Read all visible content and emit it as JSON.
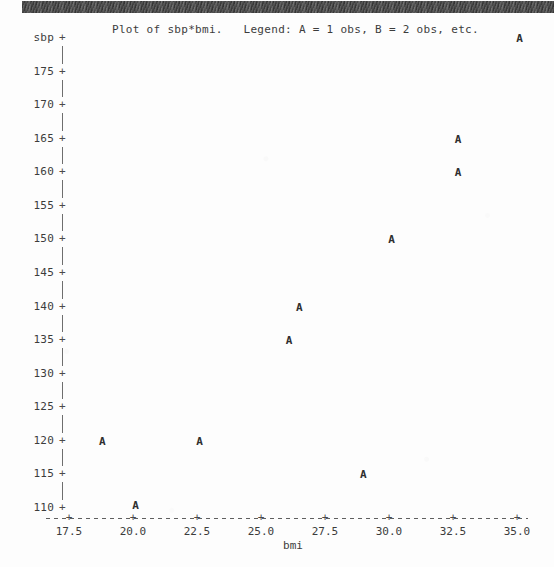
{
  "banner": {
    "name": "scan-edge-strip"
  },
  "title": "Plot of sbp*bmi.   Legend: A = 1 obs, B = 2 obs, etc.",
  "axis_title_x": "bmi",
  "axis_title_y": "sbp",
  "chart_data": {
    "type": "scatter",
    "title": "Plot of sbp*bmi.   Legend: A = 1 obs, B = 2 obs, etc.",
    "xlabel": "bmi",
    "ylabel": "sbp",
    "grid": false,
    "legend": "A = 1 obs, B = 2 obs, etc.",
    "legend_position": "in-title",
    "point_glyph": "A",
    "xlim": [
      16.9,
      35.6
    ],
    "ylim": [
      109.0,
      180.5
    ],
    "xticks": [
      17.5,
      20.0,
      22.5,
      25.0,
      27.5,
      30.0,
      32.5,
      35.0
    ],
    "xtick_labels": [
      "17.5",
      "20.0",
      "22.5",
      "25.0",
      "27.5",
      "30.0",
      "32.5",
      "35.0"
    ],
    "yticks": [
      180,
      175,
      170,
      165,
      160,
      155,
      150,
      145,
      140,
      135,
      130,
      125,
      120,
      115,
      110
    ],
    "ytick_labels": [
      "sbp",
      "175",
      "170",
      "165",
      "160",
      "155",
      "150",
      "145",
      "140",
      "135",
      "130",
      "125",
      "120",
      "115",
      "110"
    ],
    "series": [
      {
        "name": "observations",
        "marker": "A",
        "points": [
          {
            "x": 35.1,
            "y": 180.0,
            "label": "A"
          },
          {
            "x": 32.7,
            "y": 165.0,
            "label": "A"
          },
          {
            "x": 32.7,
            "y": 160.0,
            "label": "A"
          },
          {
            "x": 30.1,
            "y": 150.0,
            "label": "A"
          },
          {
            "x": 26.5,
            "y": 140.0,
            "label": "A"
          },
          {
            "x": 26.1,
            "y": 135.0,
            "label": "A"
          },
          {
            "x": 18.8,
            "y": 120.0,
            "label": "A"
          },
          {
            "x": 22.6,
            "y": 120.0,
            "label": "A"
          },
          {
            "x": 29.0,
            "y": 115.0,
            "label": "A"
          },
          {
            "x": 20.1,
            "y": 110.5,
            "label": "A"
          }
        ]
      }
    ]
  }
}
